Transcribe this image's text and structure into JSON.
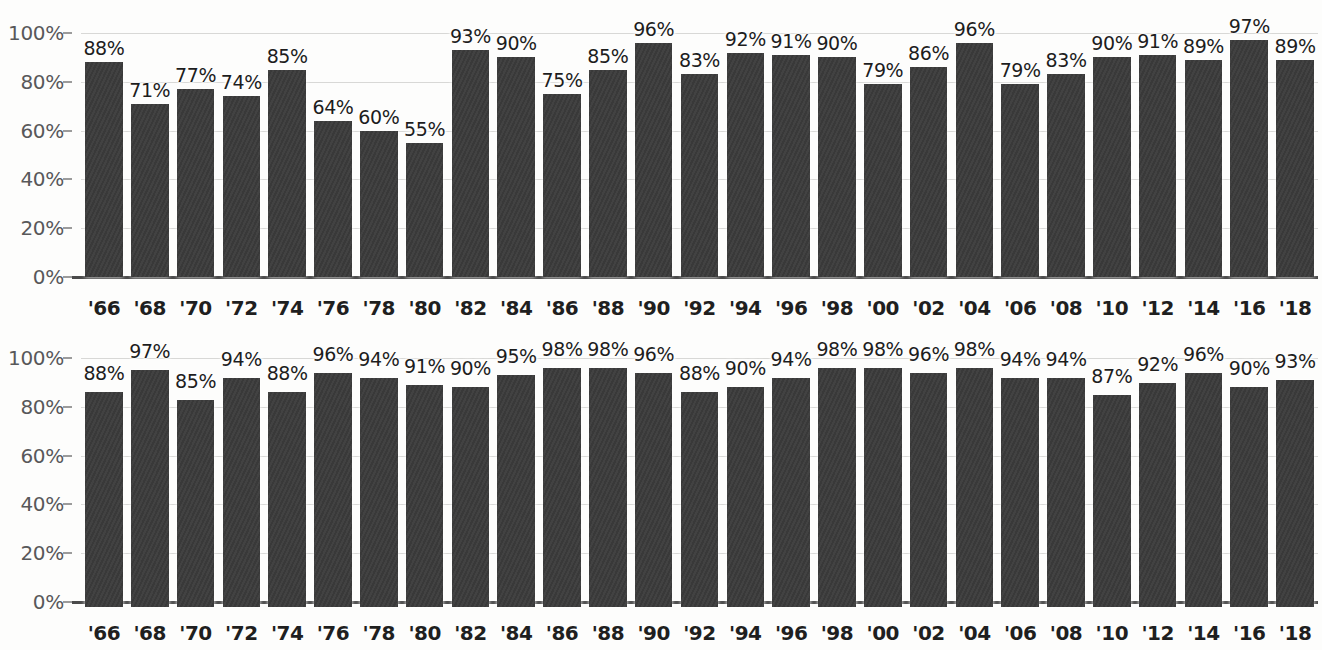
{
  "figure": {
    "background_color": "#fdfdfc",
    "bar_color": "#3b3b3b",
    "gridline_color": "#d8d8d6",
    "axis_color": "#4a4a4a",
    "tick_label_color": "#58585a"
  },
  "chart_data": [
    {
      "id": "top",
      "type": "bar",
      "title": "",
      "subtitle": "",
      "xlabel": "",
      "ylabel": "",
      "ylim": [
        0,
        100
      ],
      "yticks": [
        0,
        20,
        40,
        60,
        80,
        100
      ],
      "ytick_labels": [
        "0%",
        "20%",
        "40%",
        "60%",
        "80%",
        "100%"
      ],
      "grid": true,
      "grid_axis": "y",
      "legend": "none",
      "value_suffix": "%",
      "categories": [
        "'66",
        "'68",
        "'70",
        "'72",
        "'74",
        "'76",
        "'78",
        "'80",
        "'82",
        "'84",
        "'86",
        "'88",
        "'90",
        "'92",
        "'94",
        "'96",
        "'98",
        "'00",
        "'02",
        "'04",
        "'06",
        "'08",
        "'10",
        "'12",
        "'14",
        "'16",
        "'18"
      ],
      "values": [
        88,
        71,
        77,
        74,
        85,
        64,
        60,
        55,
        93,
        90,
        75,
        85,
        96,
        83,
        92,
        91,
        90,
        79,
        86,
        96,
        79,
        83,
        90,
        91,
        89,
        97,
        89
      ],
      "data_labels": [
        "88%",
        "71%",
        "77%",
        "74%",
        "85%",
        "64%",
        "60%",
        "55%",
        "93%",
        "90%",
        "75%",
        "85%",
        "96%",
        "83%",
        "92%",
        "91%",
        "90%",
        "79%",
        "86%",
        "96%",
        "79%",
        "83%",
        "90%",
        "91%",
        "89%",
        "97%",
        "89%"
      ]
    },
    {
      "id": "bottom",
      "type": "bar",
      "title": "",
      "subtitle": "",
      "xlabel": "",
      "ylabel": "",
      "ylim": [
        0,
        100
      ],
      "yticks": [
        0,
        20,
        40,
        60,
        80,
        100
      ],
      "ytick_labels": [
        "0%",
        "20%",
        "40%",
        "60%",
        "80%",
        "100%"
      ],
      "grid": true,
      "grid_axis": "y",
      "legend": "none",
      "value_suffix": "%",
      "categories": [
        "'66",
        "'68",
        "'70",
        "'72",
        "'74",
        "'76",
        "'78",
        "'80",
        "'82",
        "'84",
        "'86",
        "'88",
        "'90",
        "'92",
        "'94",
        "'96",
        "'98",
        "'00",
        "'02",
        "'04",
        "'06",
        "'08",
        "'10",
        "'12",
        "'14",
        "'16",
        "'18"
      ],
      "values": [
        88,
        97,
        85,
        94,
        88,
        96,
        94,
        91,
        90,
        95,
        98,
        98,
        96,
        88,
        90,
        94,
        98,
        98,
        96,
        98,
        94,
        94,
        87,
        92,
        96,
        90,
        93
      ],
      "data_labels": [
        "88%",
        "97%",
        "85%",
        "94%",
        "88%",
        "96%",
        "94%",
        "91%",
        "90%",
        "95%",
        "98%",
        "98%",
        "96%",
        "88%",
        "90%",
        "94%",
        "98%",
        "98%",
        "96%",
        "98%",
        "94%",
        "94%",
        "87%",
        "92%",
        "96%",
        "90%",
        "93%"
      ]
    }
  ]
}
